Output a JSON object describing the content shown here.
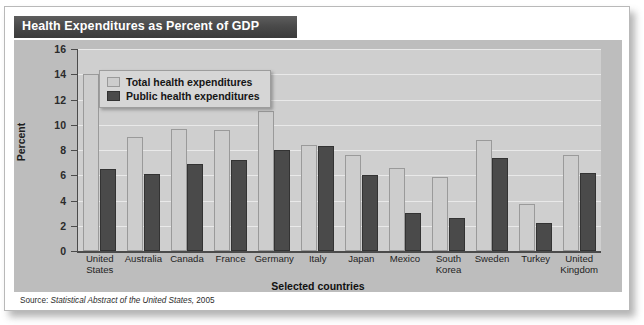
{
  "title": "Health Expenditures as Percent of GDP",
  "source": {
    "prefix": "Source:",
    "publication": "Statistical Abstract of the United States,",
    "year": "2005"
  },
  "legend": {
    "items": [
      {
        "label": "Total health expenditures",
        "color": "#cdcdcd"
      },
      {
        "label": "Public health expenditures",
        "color": "#4a4a4a"
      }
    ]
  },
  "axes": {
    "y_title": "Percent",
    "x_title": "Selected countries",
    "y_ticks": [
      "0",
      "2",
      "4",
      "6",
      "8",
      "10",
      "12",
      "14",
      "16"
    ]
  },
  "colors": {
    "titlebar": "#4a4a4a",
    "panel": "#bdbdbd",
    "plot": "#cfcfcf",
    "total_bar": "#cdcdcd",
    "public_bar": "#4a4a4a",
    "gridline": "#e9e9e9",
    "axis": "#4b4b4b"
  },
  "chart_data": {
    "type": "bar",
    "title": "Health Expenditures as Percent of GDP",
    "xlabel": "Selected countries",
    "ylabel": "Percent",
    "ylim": [
      0,
      16
    ],
    "ytick_step": 2,
    "grid": true,
    "legend_position": "upper-left-inside",
    "categories": [
      "United States",
      "Australia",
      "Canada",
      "France",
      "Germany",
      "Italy",
      "Japan",
      "Mexico",
      "South Korea",
      "Sweden",
      "Turkey",
      "United Kingdom"
    ],
    "category_lines": [
      [
        "United",
        "States"
      ],
      [
        "Australia"
      ],
      [
        "Canada"
      ],
      [
        "France"
      ],
      [
        "Germany"
      ],
      [
        "Italy"
      ],
      [
        "Japan"
      ],
      [
        "Mexico"
      ],
      [
        "South",
        "Korea"
      ],
      [
        "Sweden"
      ],
      [
        "Turkey"
      ],
      [
        "United",
        "Kingdom"
      ]
    ],
    "series": [
      {
        "name": "Total health expenditures",
        "color": "#cdcdcd",
        "values": [
          14.0,
          9.0,
          9.7,
          9.6,
          11.1,
          8.4,
          7.6,
          6.6,
          5.9,
          8.8,
          3.7,
          7.6
        ]
      },
      {
        "name": "Public health expenditures",
        "color": "#4a4a4a",
        "values": [
          6.5,
          6.1,
          6.9,
          7.2,
          8.0,
          8.3,
          6.0,
          3.0,
          2.6,
          7.4,
          2.2,
          6.2
        ]
      }
    ]
  }
}
